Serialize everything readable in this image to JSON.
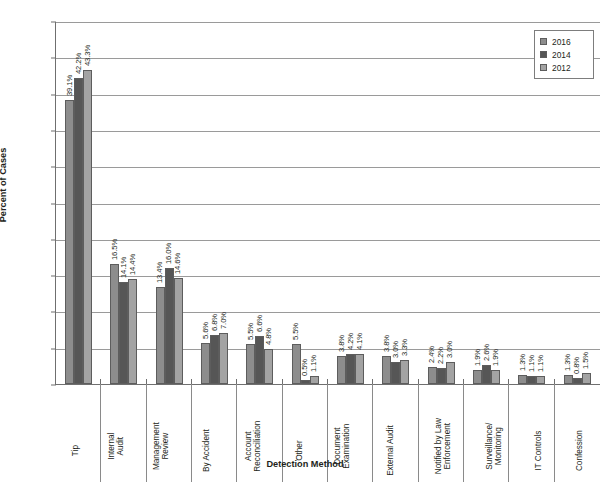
{
  "chart_data": {
    "type": "bar",
    "title": "",
    "xlabel": "Detection Method",
    "ylabel": "Percent of Cases",
    "ylim": [
      0,
      50
    ],
    "ytick_labels": [
      "0%",
      "5%",
      "10%",
      "15%",
      "20%",
      "25%",
      "30%",
      "35%",
      "40%",
      "45%",
      "50%"
    ],
    "ytick_values": [
      0,
      5,
      10,
      15,
      20,
      25,
      30,
      35,
      40,
      45,
      50
    ],
    "grid": true,
    "legend_position": "top-right",
    "categories": [
      "Tip",
      "Internal\nAudit",
      "Management\nReview",
      "By Accident",
      "Account\nReconciliation",
      "Other",
      "Document\nExamination",
      "External Audit",
      "Notified by Law\nEnforcement",
      "Surveillance/\nMonitoring",
      "IT Controls",
      "Confession"
    ],
    "series": [
      {
        "name": "2016",
        "color": "#8d8d8d",
        "values": [
          39.1,
          16.5,
          13.4,
          5.6,
          5.5,
          5.5,
          3.8,
          3.8,
          2.4,
          1.9,
          1.3,
          1.3
        ],
        "labels": [
          "39.1%",
          "16.5%",
          "13.4%",
          "5.6%",
          "5.5%",
          "5.5%",
          "3.8%",
          "3.8%",
          "2.4%",
          "1.9%",
          "1.3%",
          "1.3%"
        ]
      },
      {
        "name": "2014",
        "color": "#565656",
        "values": [
          42.2,
          14.1,
          16.0,
          6.8,
          6.6,
          0.5,
          4.2,
          3.0,
          2.2,
          2.6,
          1.1,
          0.8
        ],
        "labels": [
          "42.2%",
          "14.1%",
          "16.0%",
          "6.8%",
          "6.6%",
          "0.5%",
          "4.2%",
          "3.0%",
          "2.2%",
          "2.6%",
          "1.1%",
          "0.8%"
        ]
      },
      {
        "name": "2012",
        "color": "#a3a3a3",
        "values": [
          43.3,
          14.4,
          14.6,
          7.0,
          4.8,
          1.1,
          4.1,
          3.3,
          3.0,
          1.9,
          1.1,
          1.5
        ],
        "labels": [
          "43.3%",
          "14.4%",
          "14.6%",
          "7.0%",
          "4.8%",
          "1.1%",
          "4.1%",
          "3.3%",
          "3.0%",
          "1.9%",
          "1.1%",
          "1.5%"
        ]
      }
    ]
  },
  "legend": {
    "items": [
      {
        "label": "2016"
      },
      {
        "label": "2014"
      },
      {
        "label": "2012"
      }
    ]
  }
}
